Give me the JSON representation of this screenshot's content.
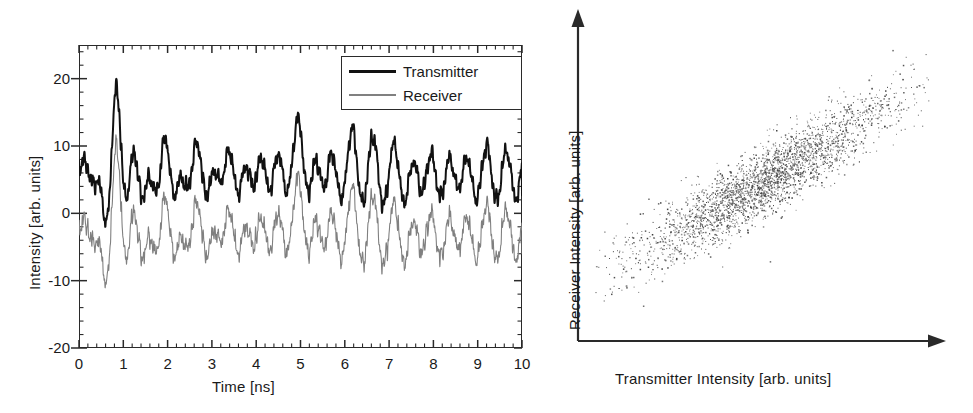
{
  "figure": {
    "panels": [
      {
        "id": "time-series",
        "type": "line",
        "xlabel": "Time [ns]",
        "ylabel": "Intensity [arb. units]",
        "legend": [
          {
            "label": "Transmitter",
            "color": "#111111",
            "width": 2.0
          },
          {
            "label": "Receiver",
            "color": "#808080",
            "width": 1.1
          }
        ],
        "xticklabels": [
          "0",
          "1",
          "2",
          "3",
          "4",
          "5",
          "6",
          "7",
          "8",
          "9",
          "10"
        ],
        "yticklabels": [
          "20",
          "10",
          "0",
          "-10",
          "-20"
        ]
      },
      {
        "id": "correlation",
        "type": "scatter",
        "xlabel": "Transmitter Intensity [arb. units]",
        "ylabel": "Receiver Intensity [arb. units]",
        "xticklabels": [],
        "yticklabels": []
      }
    ]
  },
  "chart_data": [
    {
      "type": "line",
      "title": "",
      "xlabel": "Time [ns]",
      "ylabel": "Intensity [arb. units]",
      "xlim": [
        0,
        10
      ],
      "ylim": [
        -20,
        25
      ],
      "xticks": [
        0,
        1,
        2,
        3,
        4,
        5,
        6,
        7,
        8,
        9,
        10
      ],
      "yticks": [
        -20,
        -10,
        0,
        10,
        20
      ],
      "xminor_step": 0.2,
      "yminor_step": 2,
      "grid": false,
      "legend_position": "top-right",
      "series": [
        {
          "name": "Transmitter",
          "color": "#111111",
          "linewidth": 2.0,
          "offset": 0,
          "x": [
            0.0,
            0.05,
            0.1,
            0.15,
            0.2,
            0.25,
            0.3,
            0.35,
            0.4,
            0.45,
            0.5,
            0.55,
            0.6,
            0.65,
            0.7,
            0.75,
            0.8,
            0.85,
            0.9,
            0.95,
            1.0,
            1.05,
            1.1,
            1.15,
            1.2,
            1.25,
            1.3,
            1.35,
            1.4,
            1.45,
            1.5,
            1.55,
            1.6,
            1.65,
            1.7,
            1.75,
            1.8,
            1.85,
            1.9,
            1.95,
            2.0,
            2.05,
            2.1,
            2.15,
            2.2,
            2.25,
            2.3,
            2.35,
            2.4,
            2.45,
            2.5,
            2.55,
            2.6,
            2.65,
            2.7,
            2.75,
            2.8,
            2.85,
            2.9,
            2.95,
            3.0,
            3.05,
            3.1,
            3.15,
            3.2,
            3.25,
            3.3,
            3.35,
            3.4,
            3.45,
            3.5,
            3.55,
            3.6,
            3.65,
            3.7,
            3.75,
            3.8,
            3.85,
            3.9,
            3.95,
            4.0,
            4.05,
            4.1,
            4.15,
            4.2,
            4.25,
            4.3,
            4.35,
            4.4,
            4.45,
            4.5,
            4.55,
            4.6,
            4.65,
            4.7,
            4.75,
            4.8,
            4.85,
            4.9,
            4.95,
            5.0,
            5.05,
            5.1,
            5.15,
            5.2,
            5.25,
            5.3,
            5.35,
            5.4,
            5.45,
            5.5,
            5.55,
            5.6,
            5.65,
            5.7,
            5.75,
            5.8,
            5.85,
            5.9,
            5.95,
            6.0,
            6.05,
            6.1,
            6.15,
            6.2,
            6.25,
            6.3,
            6.35,
            6.4,
            6.45,
            6.5,
            6.55,
            6.6,
            6.65,
            6.7,
            6.75,
            6.8,
            6.85,
            6.9,
            6.95,
            7.0,
            7.05,
            7.1,
            7.15,
            7.2,
            7.25,
            7.3,
            7.35,
            7.4,
            7.45,
            7.5,
            7.55,
            7.6,
            7.65,
            7.7,
            7.75,
            7.8,
            7.85,
            7.9,
            7.95,
            8.0,
            8.05,
            8.1,
            8.15,
            8.2,
            8.25,
            8.3,
            8.35,
            8.4,
            8.45,
            8.5,
            8.55,
            8.6,
            8.65,
            8.7,
            8.75,
            8.8,
            8.85,
            8.9,
            8.95,
            9.0,
            9.05,
            9.1,
            9.15,
            9.2,
            9.25,
            9.3,
            9.35,
            9.4,
            9.45,
            9.5,
            9.55,
            9.6,
            9.65,
            9.7,
            9.75,
            9.8,
            9.85,
            9.9,
            9.95,
            10.0
          ],
          "y": [
            6.6,
            7.2,
            7.8,
            7.6,
            6.6,
            5.4,
            4.6,
            4.4,
            4.8,
            4.6,
            3.2,
            0.6,
            -1.4,
            -0.6,
            4.0,
            11.0,
            17.0,
            18.8,
            16.0,
            10.0,
            4.6,
            2.2,
            3.0,
            5.6,
            8.4,
            9.2,
            7.4,
            4.6,
            2.6,
            2.4,
            3.6,
            5.0,
            5.4,
            4.6,
            3.4,
            3.0,
            4.4,
            7.4,
            10.4,
            11.4,
            9.8,
            6.6,
            3.8,
            2.6,
            3.2,
            4.6,
            5.4,
            5.0,
            4.0,
            3.6,
            4.6,
            6.8,
            9.2,
            10.6,
            10.0,
            7.6,
            4.8,
            3.0,
            2.8,
            4.0,
            5.6,
            6.4,
            6.0,
            5.0,
            4.6,
            5.4,
            7.2,
            9.0,
            9.4,
            8.0,
            5.6,
            3.6,
            3.0,
            4.0,
            5.8,
            7.0,
            6.8,
            5.6,
            4.4,
            4.2,
            5.2,
            7.0,
            8.2,
            8.0,
            6.2,
            4.2,
            3.4,
            4.2,
            6.2,
            8.2,
            9.0,
            8.0,
            5.8,
            3.8,
            3.2,
            4.4,
            7.0,
            10.4,
            13.2,
            14.2,
            12.6,
            9.0,
            5.4,
            3.4,
            3.4,
            5.0,
            7.0,
            8.0,
            7.2,
            5.4,
            4.0,
            4.0,
            5.6,
            7.8,
            9.0,
            8.4,
            6.2,
            3.8,
            2.4,
            2.6,
            4.4,
            7.4,
            10.6,
            12.6,
            12.2,
            9.4,
            5.6,
            2.6,
            1.4,
            2.4,
            5.0,
            8.4,
            11.0,
            11.6,
            9.8,
            6.4,
            3.2,
            1.4,
            1.6,
            3.4,
            6.2,
            9.0,
            10.4,
            9.8,
            7.4,
            4.4,
            2.2,
            1.6,
            2.8,
            5.0,
            7.0,
            7.8,
            7.0,
            5.2,
            3.6,
            3.2,
            4.2,
            6.2,
            8.2,
            9.0,
            8.0,
            5.8,
            3.6,
            2.4,
            2.8,
            4.6,
            6.8,
            8.2,
            8.0,
            6.4,
            4.6,
            3.6,
            4.0,
            5.6,
            7.4,
            8.4,
            7.8,
            5.8,
            3.6,
            2.2,
            2.4,
            4.2,
            6.8,
            9.2,
            10.2,
            9.2,
            6.6,
            3.8,
            2.0,
            2.0,
            3.8,
            6.4,
            8.6,
            9.4,
            8.4,
            6.0,
            3.6,
            2.2,
            2.6,
            4.6,
            7.4,
            9.8,
            10.6,
            9.2,
            6.4,
            3.6,
            2.0,
            2.4
          ]
        },
        {
          "name": "Receiver",
          "color": "#808080",
          "linewidth": 1.1,
          "offset": -9,
          "note": "Nearly identical chaotic waveform as Transmitter, vertically offset by about -9 units, with small synchronization-error noise."
        }
      ],
      "annotations": [
        "Two chaotic intensity traces are strongly synchronized; the Receiver trace is offset downward for clarity."
      ]
    },
    {
      "type": "scatter",
      "title": "",
      "xlabel": "Transmitter Intensity [arb. units]",
      "ylabel": "Receiver Intensity [arb. units]",
      "xlim": [
        0,
        1
      ],
      "ylim": [
        0,
        1
      ],
      "xticks": [],
      "yticks": [],
      "grid": false,
      "legend_position": "none",
      "n_points": 3000,
      "correlation": 0.97,
      "slope": 1.0,
      "cloud": {
        "x_range": [
          0.12,
          0.92
        ],
        "y_range": [
          0.1,
          0.9
        ],
        "major_axis_angle_deg": 35,
        "spread_along": 0.22,
        "spread_across": 0.045,
        "point_color": "#555555",
        "point_size": 1.2
      },
      "annotations": [
        "Elongated diagonal point cloud indicating high correlation between transmitter and receiver intensities."
      ]
    }
  ]
}
